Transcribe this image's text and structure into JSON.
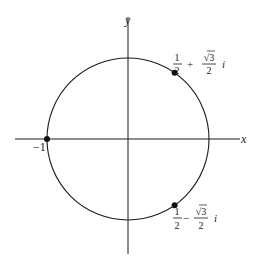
{
  "diagram": {
    "type": "complex-plane-unit-circle",
    "axes": {
      "x_label": "x",
      "y_label": "y"
    },
    "circle": {
      "center": [
        0,
        0
      ],
      "radius": 1
    },
    "points": [
      {
        "name": "minus-one",
        "re": -1,
        "im": 0,
        "label": "−1"
      },
      {
        "name": "upper-root",
        "re": 0.5,
        "im": 0.8660254,
        "label": {
          "real_num": "1",
          "real_den": "2",
          "sign": "+",
          "imag_num": "√3",
          "imag_den": "2",
          "unit": "i"
        }
      },
      {
        "name": "lower-root",
        "re": 0.5,
        "im": -0.8660254,
        "label": {
          "real_num": "1",
          "real_den": "2",
          "sign": "−",
          "imag_num": "√3",
          "imag_den": "2",
          "unit": "i"
        }
      }
    ],
    "colors": {
      "stroke": "#1a1a1a",
      "background": "#ffffff"
    }
  }
}
